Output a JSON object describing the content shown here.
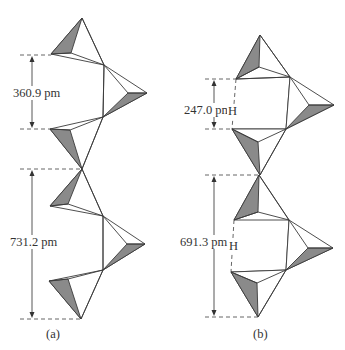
{
  "figure": {
    "panel_a": {
      "caption": "(a)",
      "dimensions": [
        {
          "label": "360.9 pm",
          "from_y": 55,
          "to_y": 129
        },
        {
          "label": "731.2 pm",
          "from_y": 169,
          "to_y": 319
        }
      ]
    },
    "panel_b": {
      "caption": "(b)",
      "dimensions": [
        {
          "label": "247.0 pm",
          "hydrogen": "H",
          "from_y": 79,
          "to_y": 129
        },
        {
          "label": "691.3 pm",
          "hydrogen": "H",
          "from_y": 175,
          "to_y": 317
        }
      ]
    },
    "colors": {
      "shaded_face": "#8a8a8a",
      "line": "#3a3a3a",
      "background": "#ffffff"
    }
  }
}
